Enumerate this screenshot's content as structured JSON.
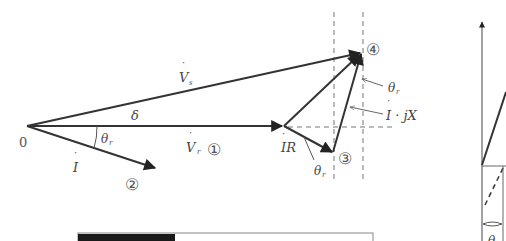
{
  "diagram": {
    "origin_label": "0",
    "vectors": {
      "Vs": {
        "label": "V",
        "dot": "·",
        "sub": "s"
      },
      "Vr": {
        "label": "V",
        "dot": "·",
        "sub": "r"
      },
      "I": {
        "label": "I",
        "dot": "·"
      },
      "IR": {
        "label": "IR",
        "dot": "·"
      },
      "IjX": {
        "label": "I · jX",
        "dot": "·"
      }
    },
    "angles": {
      "delta": "δ",
      "theta_r_main": {
        "symbol": "θ",
        "sub": "r"
      },
      "theta_r_ir": {
        "symbol": "θ",
        "sub": "r"
      },
      "theta_r_top": {
        "symbol": "θ",
        "sub": "r"
      }
    },
    "points": {
      "p1": "①",
      "p2": "②",
      "p3": "③",
      "p4": "④"
    },
    "right_fragment": {
      "angle_label": "θ"
    },
    "colors": {
      "line": "#333333",
      "dashed": "#777777",
      "bar_fill": "#1a1a1a",
      "bar_border": "#888888"
    }
  }
}
